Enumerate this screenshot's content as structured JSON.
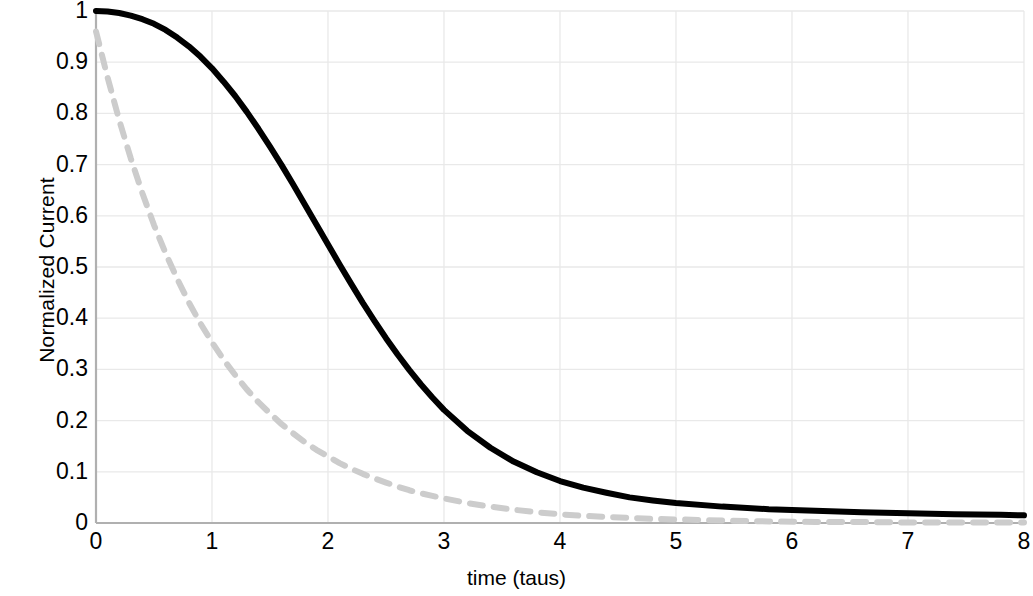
{
  "chart_data": {
    "type": "line",
    "title": "",
    "xlabel": "time (taus)",
    "ylabel": "Normalized Current",
    "xlim": [
      0,
      8
    ],
    "ylim": [
      0,
      1
    ],
    "grid": true,
    "legend": null,
    "x_ticks": [
      "0",
      "1",
      "2",
      "3",
      "4",
      "5",
      "6",
      "7",
      "8"
    ],
    "y_ticks": [
      "0",
      "0.1",
      "0.2",
      "0.3",
      "0.4",
      "0.5",
      "0.6",
      "0.7",
      "0.8",
      "0.9",
      "1"
    ],
    "x_tick_values": [
      0,
      1,
      2,
      3,
      4,
      5,
      6,
      7,
      8
    ],
    "y_tick_values": [
      0,
      0.1,
      0.2,
      0.3,
      0.4,
      0.5,
      0.6,
      0.7,
      0.8,
      0.9,
      1
    ],
    "x": [
      0,
      0.1,
      0.2,
      0.3,
      0.4,
      0.5,
      0.6,
      0.7,
      0.8,
      0.9,
      1,
      1.1,
      1.2,
      1.3,
      1.4,
      1.5,
      1.6,
      1.7,
      1.8,
      1.9,
      2,
      2.1,
      2.2,
      2.3,
      2.4,
      2.5,
      2.6,
      2.7,
      2.8,
      2.9,
      3,
      3.2,
      3.4,
      3.6,
      3.8,
      4,
      4.2,
      4.4,
      4.6,
      4.8,
      5,
      5.4,
      5.8,
      6.2,
      6.6,
      7,
      7.4,
      7.8,
      8
    ],
    "series": [
      {
        "name": "solid-black-curve",
        "style": "solid",
        "color": "#000000",
        "width": 6,
        "values": [
          1,
          0.999,
          0.996,
          0.991,
          0.984,
          0.975,
          0.963,
          0.948,
          0.931,
          0.911,
          0.888,
          0.862,
          0.834,
          0.803,
          0.77,
          0.735,
          0.699,
          0.661,
          0.622,
          0.583,
          0.544,
          0.505,
          0.467,
          0.43,
          0.395,
          0.361,
          0.329,
          0.299,
          0.271,
          0.245,
          0.221,
          0.18,
          0.147,
          0.12,
          0.099,
          0.082,
          0.069,
          0.059,
          0.05,
          0.044,
          0.039,
          0.032,
          0.027,
          0.024,
          0.021,
          0.019,
          0.017,
          0.016,
          0.015
        ]
      },
      {
        "name": "dashed-gray-curve",
        "style": "dashed",
        "color": "#cccccc",
        "width": 6,
        "values": [
          0.96,
          0.87,
          0.787,
          0.712,
          0.644,
          0.582,
          0.527,
          0.477,
          0.431,
          0.39,
          0.353,
          0.319,
          0.289,
          0.261,
          0.236,
          0.214,
          0.193,
          0.175,
          0.158,
          0.143,
          0.13,
          0.117,
          0.106,
          0.096,
          0.087,
          0.079,
          0.071,
          0.064,
          0.058,
          0.053,
          0.048,
          0.039,
          0.032,
          0.026,
          0.021,
          0.017,
          0.014,
          0.012,
          0.01,
          0.008,
          0.007,
          0.005,
          0.003,
          0.002,
          0.002,
          0.001,
          0.001,
          0.001,
          0.001
        ]
      }
    ],
    "colors": {
      "gridline": "#e9e9e9",
      "axis": "#b0b0b0",
      "text": "#000000",
      "background": "#ffffff"
    }
  }
}
